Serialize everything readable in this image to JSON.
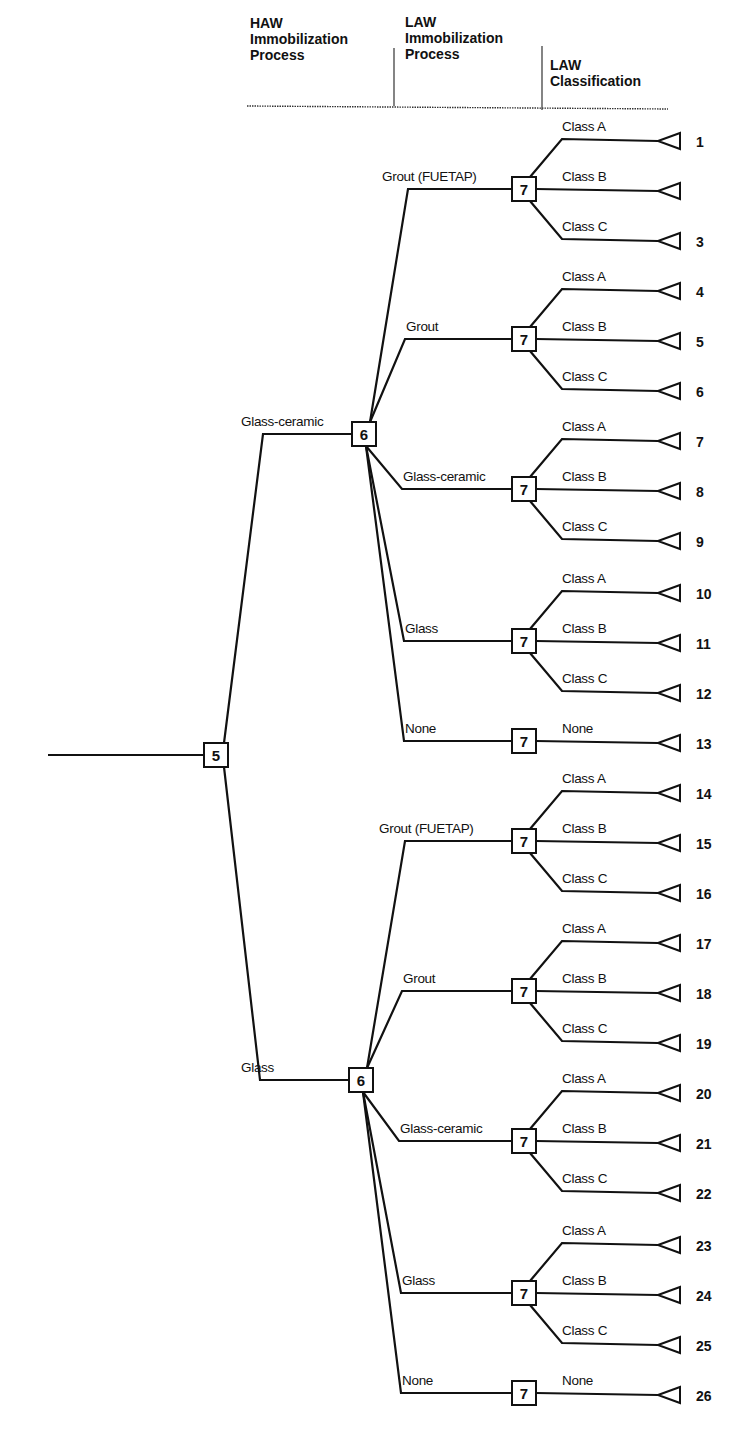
{
  "headers": [
    {
      "lines": [
        "HAW",
        "Immobilization",
        "Process"
      ]
    },
    {
      "lines": [
        "LAW",
        "Immobilization",
        "Process"
      ]
    },
    {
      "lines": [
        "LAW",
        "Classification"
      ]
    }
  ],
  "root": {
    "node_label": "5",
    "branches": [
      {
        "label": "Glass-ceramic",
        "node_label": "6",
        "children": [
          {
            "label": "Grout (FUETAP)",
            "node_label": "7",
            "outcomes": [
              {
                "label": "Class A",
                "number": "1"
              },
              {
                "label": "Class B",
                "number": ""
              },
              {
                "label": "Class C",
                "number": "3"
              }
            ]
          },
          {
            "label": "Grout",
            "node_label": "7",
            "outcomes": [
              {
                "label": "Class A",
                "number": "4"
              },
              {
                "label": "Class B",
                "number": "5"
              },
              {
                "label": "Class C",
                "number": "6"
              }
            ]
          },
          {
            "label": "Glass-ceramic",
            "node_label": "7",
            "outcomes": [
              {
                "label": "Class A",
                "number": "7"
              },
              {
                "label": "Class B",
                "number": "8"
              },
              {
                "label": "Class C",
                "number": "9"
              }
            ]
          },
          {
            "label": "Glass",
            "node_label": "7",
            "outcomes": [
              {
                "label": "Class A",
                "number": "10"
              },
              {
                "label": "Class B",
                "number": "11"
              },
              {
                "label": "Class C",
                "number": "12"
              }
            ]
          },
          {
            "label": "None",
            "node_label": "7",
            "outcomes": [
              {
                "label": "None",
                "number": "13"
              }
            ]
          }
        ]
      },
      {
        "label": "Glass",
        "node_label": "6",
        "children": [
          {
            "label": "Grout (FUETAP)",
            "node_label": "7",
            "outcomes": [
              {
                "label": "Class A",
                "number": "14"
              },
              {
                "label": "Class B",
                "number": "15"
              },
              {
                "label": "Class C",
                "number": "16"
              }
            ]
          },
          {
            "label": "Grout",
            "node_label": "7",
            "outcomes": [
              {
                "label": "Class A",
                "number": "17"
              },
              {
                "label": "Class B",
                "number": "18"
              },
              {
                "label": "Class C",
                "number": "19"
              }
            ]
          },
          {
            "label": "Glass-ceramic",
            "node_label": "7",
            "outcomes": [
              {
                "label": "Class A",
                "number": "20"
              },
              {
                "label": "Class B",
                "number": "21"
              },
              {
                "label": "Class C",
                "number": "22"
              }
            ]
          },
          {
            "label": "Glass",
            "node_label": "7",
            "outcomes": [
              {
                "label": "Class A",
                "number": "23"
              },
              {
                "label": "Class B",
                "number": "24"
              },
              {
                "label": "Class C",
                "number": "25"
              }
            ]
          },
          {
            "label": "None",
            "node_label": "7",
            "outcomes": [
              {
                "label": "None",
                "number": "26"
              }
            ]
          }
        ]
      }
    ]
  }
}
